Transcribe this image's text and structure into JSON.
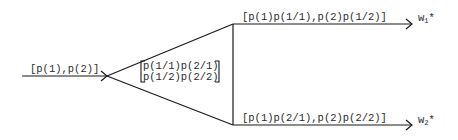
{
  "diagram": {
    "input": {
      "label": "[p(1),p(2)]"
    },
    "channel": {
      "row1": "p(1/1)p(2/1)",
      "row2": "p(1/2)p(2/2)"
    },
    "outputs": [
      {
        "label": "[p(1)p(1/1),p(2)p(1/2)]",
        "target": "w",
        "sub": "1",
        "sup": "*"
      },
      {
        "label": "[p(1)p(2/1),p(2)p(2/2)]",
        "target": "w",
        "sub": "2",
        "sup": "*"
      }
    ],
    "colors": {
      "line": "#1a1a1a",
      "text": "#2a2a2a"
    }
  }
}
